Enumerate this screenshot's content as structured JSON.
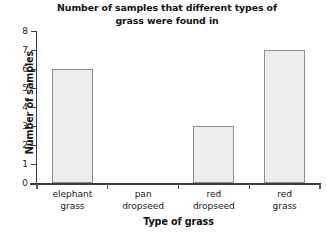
{
  "chart_data": {
    "type": "bar",
    "title": "Number of samples that different types of\ngrass were found in",
    "title_line1": "Number of samples that different types of",
    "title_line2": "grass were found in",
    "xlabel": "Type of grass",
    "ylabel": "Number of samples",
    "categories": [
      "elephant grass",
      "pan dropseed",
      "red dropseed",
      "red grass"
    ],
    "category_lines": [
      [
        "elephant",
        "grass"
      ],
      [
        "pan",
        "dropseed"
      ],
      [
        "red",
        "dropseed"
      ],
      [
        "red",
        "grass"
      ]
    ],
    "values": [
      6,
      0,
      3,
      7
    ],
    "ylim": [
      0,
      8
    ],
    "ytick_labels": [
      "8",
      "7",
      "6",
      "5",
      "4",
      "3",
      "2",
      "1",
      "0"
    ],
    "ytick_values": [
      8,
      7,
      6,
      5,
      4,
      3,
      2,
      1,
      0
    ],
    "grid": false,
    "legend": null,
    "bar_fill_color": "#ececed",
    "bar_border_color": "#8d8d8d",
    "axis_color": "#3d3d3d",
    "background_color": "#ffffff"
  }
}
